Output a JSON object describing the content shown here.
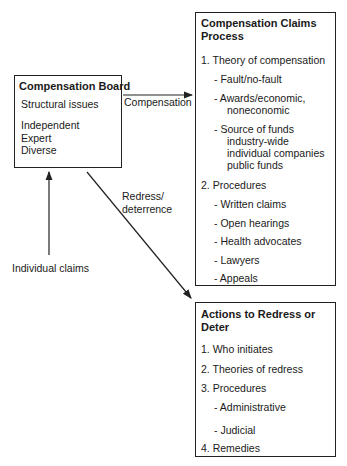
{
  "board": {
    "title": "Compensation Board",
    "items": [
      "Structural issues",
      "Independent",
      "Expert",
      "Diverse"
    ]
  },
  "claims_process": {
    "title_line1": "Compensation Claims",
    "title_line2": "Process",
    "section1": {
      "label": "1.  Theory of compensation",
      "items": [
        "- Fault/no-fault",
        "- Awards/economic,",
        "noneconomic",
        "- Source of funds",
        "industry-wide",
        "individual companies",
        "public funds"
      ]
    },
    "section2": {
      "label": "2.  Procedures",
      "items": [
        "- Written claims",
        "- Open hearings",
        "- Health advocates",
        "- Lawyers",
        "- Appeals"
      ]
    }
  },
  "redress": {
    "title_line1": "Actions to Redress or",
    "title_line2": "Deter",
    "items": [
      "1.  Who initiates",
      "2.  Theories of redress",
      "3.  Procedures",
      "- Administrative",
      "- Judicial",
      "4.  Remedies"
    ]
  },
  "arrows": {
    "compensation": "Compensation",
    "redress_line1": "Redress/",
    "redress_line2": "deterrence",
    "individual_claims": "Individual claims"
  }
}
